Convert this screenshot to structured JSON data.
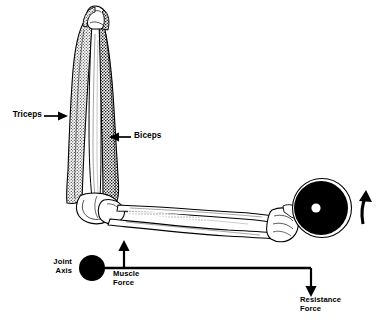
{
  "figure": {
    "background_color": "#ffffff",
    "ink_color": "#000000",
    "type": "anatomical-biomechanics-diagram"
  },
  "anatomy_labels": {
    "triceps": {
      "text": "Triceps",
      "arrow": "arrow-right"
    },
    "biceps": {
      "text": "Biceps",
      "arrow": "arrow-left"
    }
  },
  "lever_diagram": {
    "joint_axis": {
      "text": "Joint\nAxis",
      "marker": "filled-circle"
    },
    "muscle_force": {
      "text": "Muscle\nForce",
      "arrow": "arrow-up"
    },
    "resistance_force": {
      "text": "Resistance\nForce",
      "arrow": "arrow-down"
    }
  },
  "weight": {
    "name": "weight-plate",
    "plate_color": "#000000",
    "hub_color": "#ffffff",
    "rotation_arrow": "curved-arrow-up"
  }
}
